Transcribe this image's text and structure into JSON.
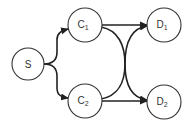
{
  "diagram": {
    "type": "directed-graph",
    "colors": {
      "node_stroke": "#333333",
      "node_fill": "#ffffff",
      "edge": "#222222",
      "text": "#333333"
    },
    "nodes": [
      {
        "id": "S",
        "label": "S",
        "sub": "",
        "cx": 28,
        "cy": 64,
        "r": 16
      },
      {
        "id": "C1",
        "label": "C",
        "sub": "1",
        "cx": 85,
        "cy": 25,
        "r": 17
      },
      {
        "id": "C2",
        "label": "C",
        "sub": "2",
        "cx": 85,
        "cy": 101,
        "r": 17
      },
      {
        "id": "D1",
        "label": "D",
        "sub": "1",
        "cx": 164,
        "cy": 25,
        "r": 17
      },
      {
        "id": "D2",
        "label": "D",
        "sub": "2",
        "cx": 164,
        "cy": 102,
        "r": 17
      }
    ],
    "edges": [
      {
        "from": "S",
        "to": "C1"
      },
      {
        "from": "S",
        "to": "C2"
      },
      {
        "from": "C1",
        "to": "D1"
      },
      {
        "from": "C1",
        "to": "D2"
      },
      {
        "from": "C2",
        "to": "D1"
      },
      {
        "from": "C2",
        "to": "D2"
      }
    ]
  }
}
